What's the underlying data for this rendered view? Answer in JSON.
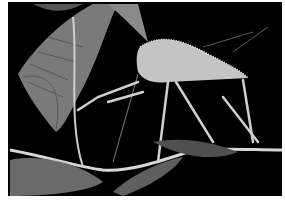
{
  "image": {
    "subject": "katydid insect on plant stem with leaves",
    "background_color": "#000000",
    "palette": {
      "body": "#c9c9c9",
      "leaf": "#8a8a8a",
      "leaf_dark": "#4a4a4a",
      "stem": "#d8d8d8"
    }
  }
}
